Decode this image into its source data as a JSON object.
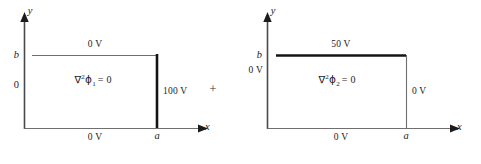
{
  "figure": {
    "caption": "",
    "operator_plus": "+",
    "ink_color": "#1c1c1c",
    "thin_line_color": "#6f6f6f",
    "thick_line_color": "#141414"
  },
  "panels": [
    {
      "id": "panel-left",
      "equation": {
        "nabla": "∇",
        "nabla_exponent": "2",
        "phi": "ϕ",
        "phi_subscript": "1",
        "equals_zero": "= 0",
        "full_text": "∇2ϕ1 = 0"
      },
      "axes": {
        "x_label": "x",
        "y_label": "y"
      },
      "y_ticks": [
        {
          "label": "b",
          "style": "italic"
        },
        {
          "label": "0",
          "style": "roman"
        }
      ],
      "x_ticks": [
        {
          "label": "a",
          "style": "italic"
        }
      ],
      "boundaries": {
        "top": {
          "label": "0 V",
          "weight": "thin"
        },
        "bottom": {
          "label": "0 V",
          "weight": "thin"
        },
        "right": {
          "label": "100 V",
          "weight": "thick"
        }
      }
    },
    {
      "id": "panel-right",
      "equation": {
        "nabla": "∇",
        "nabla_exponent": "2",
        "phi": "ϕ",
        "phi_subscript": "2",
        "equals_zero": "= 0",
        "full_text": "∇2ϕ2 = 0"
      },
      "axes": {
        "x_label": "x",
        "y_label": "y"
      },
      "y_ticks": [
        {
          "label": "b",
          "style": "italic"
        },
        {
          "label": "0 V",
          "style": "roman"
        }
      ],
      "x_ticks": [
        {
          "label": "a",
          "style": "italic"
        }
      ],
      "boundaries": {
        "top": {
          "label": "50 V",
          "weight": "thick"
        },
        "bottom": {
          "label": "0 V",
          "weight": "thin"
        },
        "right": {
          "label": "0 V",
          "weight": "thin"
        }
      }
    }
  ]
}
